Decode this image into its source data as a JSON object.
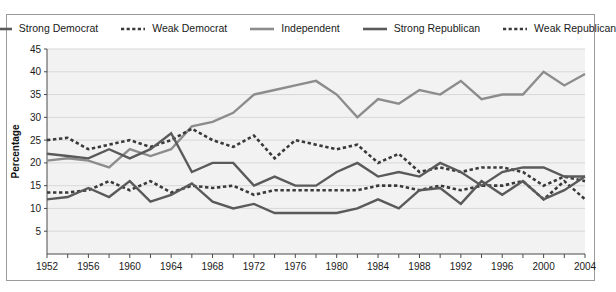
{
  "chart_data": {
    "type": "line",
    "title": "",
    "xlabel": "",
    "ylabel": "Percentage",
    "xlim": [
      1952,
      2004
    ],
    "ylim": [
      0,
      45
    ],
    "yticks": [
      5,
      10,
      15,
      20,
      25,
      30,
      35,
      40,
      45
    ],
    "xticks_major": [
      1952,
      1956,
      1960,
      1964,
      1968,
      1972,
      1976,
      1980,
      1984,
      1988,
      1992,
      1996,
      2000,
      2004
    ],
    "xticks_minor_step": 2,
    "grid": true,
    "legend_position": "top",
    "x": [
      1952,
      1954,
      1956,
      1958,
      1960,
      1962,
      1964,
      1966,
      1968,
      1970,
      1972,
      1974,
      1976,
      1978,
      1980,
      1982,
      1984,
      1986,
      1988,
      1990,
      1992,
      1994,
      1996,
      1998,
      2000,
      2002,
      2004
    ],
    "series": [
      {
        "name": "Strong Democrat",
        "style": "solid",
        "color": "#5a5a5a",
        "values": [
          22,
          21.5,
          21,
          23,
          21,
          23,
          26.5,
          18,
          20,
          20,
          15,
          17,
          15,
          15,
          18,
          20,
          17,
          18,
          17,
          20,
          18,
          15,
          18,
          19,
          19,
          17,
          17
        ]
      },
      {
        "name": "Weak Democrat",
        "style": "dashed",
        "color": "#3a3a3a",
        "values": [
          25,
          25.5,
          23,
          24,
          25,
          23.5,
          25,
          27.5,
          25,
          23.5,
          26,
          21,
          25,
          24,
          23,
          24,
          20,
          22,
          18,
          19,
          18,
          19,
          19,
          18,
          15,
          17,
          16
        ]
      },
      {
        "name": "Independent",
        "style": "solid",
        "color": "#8c8c8c",
        "values": [
          20.5,
          21,
          20.5,
          19,
          23,
          21.5,
          23,
          28,
          29,
          31,
          35,
          36,
          37,
          38,
          35,
          30,
          34,
          33,
          36,
          35,
          38,
          34,
          35,
          35,
          40,
          37,
          39.5
        ]
      },
      {
        "name": "Strong Republican",
        "style": "solid",
        "color": "#5a5a5a",
        "values": [
          12,
          12.5,
          14.5,
          12.5,
          16,
          11.5,
          13,
          15.5,
          11.5,
          10,
          11,
          9,
          9,
          9,
          9,
          10,
          12,
          10,
          14,
          14.5,
          11,
          16,
          13,
          16,
          12,
          14,
          17
        ]
      },
      {
        "name": "Weak Republican",
        "style": "dashed",
        "color": "#3a3a3a",
        "values": [
          13.5,
          13.5,
          14,
          16,
          14,
          16,
          13.5,
          15,
          14.5,
          15,
          13,
          14,
          14,
          14,
          14,
          14,
          15,
          15,
          14,
          15,
          14,
          15,
          15,
          16,
          12,
          16,
          12
        ]
      }
    ]
  },
  "legend": {
    "entries": [
      {
        "label": "Strong Democrat",
        "style": "solid",
        "color": "#5a5a5a"
      },
      {
        "label": "Weak Democrat",
        "style": "dashed",
        "color": "#3a3a3a"
      },
      {
        "label": "Independent",
        "style": "solid",
        "color": "#8c8c8c"
      },
      {
        "label": "Strong Republican",
        "style": "solid",
        "color": "#5a5a5a"
      },
      {
        "label": "Weak Republican",
        "style": "dashed",
        "color": "#3a3a3a"
      }
    ]
  },
  "axes": {
    "y_title": "Percentage"
  }
}
